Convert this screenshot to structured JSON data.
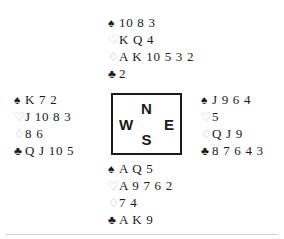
{
  "diagram": {
    "type": "bridge-deal",
    "suit_glyphs": {
      "spades": "♠",
      "hearts": "♡",
      "diamonds": "♢",
      "clubs": "♣"
    },
    "colors": {
      "ink": "#1a1a1a",
      "light_suit": "#b9b9b9",
      "background": "#ffffff",
      "rule": "#cfcfcf"
    },
    "compass": {
      "north": "N",
      "south": "S",
      "west": "W",
      "east": "E"
    },
    "hands": {
      "north": {
        "label": "North",
        "spades": "10 8 3",
        "hearts": "K Q 4",
        "diamonds": "A K 10 5 3 2",
        "clubs": "2"
      },
      "west": {
        "label": "West",
        "spades": "K 7 2",
        "hearts": "J 10 8 3",
        "diamonds": "8 6",
        "clubs": "Q J 10 5"
      },
      "east": {
        "label": "East",
        "spades": "J 9 6 4",
        "hearts": "5",
        "diamonds": "Q J 9",
        "clubs": "8 7 6 4 3"
      },
      "south": {
        "label": "South",
        "spades": "A Q 5",
        "hearts": "A 9 7 6 2",
        "diamonds": "7 4",
        "clubs": "A K 9"
      }
    }
  }
}
